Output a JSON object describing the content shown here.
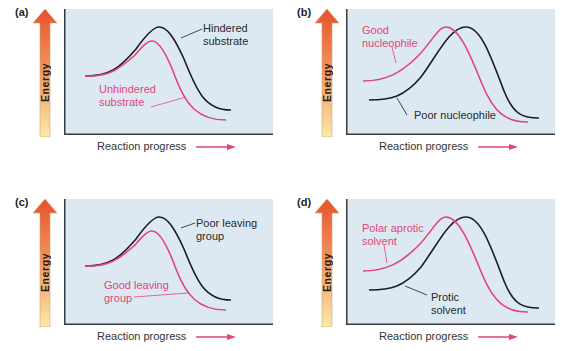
{
  "colors": {
    "plot_background": "#dde9f2",
    "axis": "#3a3a3a",
    "black_curve": "#1c1c24",
    "pink_curve": "#e0457a",
    "arrow_top": "#e8512b",
    "arrow_bottom": "#fbe7a6"
  },
  "axis": {
    "y_label": "Energy",
    "x_label": "Reaction progress"
  },
  "panels": [
    {
      "id": "a",
      "label": "(a)",
      "black_label_line1": "Hindered",
      "black_label_line2": "substrate",
      "pink_label_line1": "Unhindered",
      "pink_label_line2": "substrate"
    },
    {
      "id": "b",
      "label": "(b)",
      "pink_label_line1": "Good",
      "pink_label_line2": "nucleophile",
      "black_label_line1": "Poor nucleophile"
    },
    {
      "id": "c",
      "label": "(c)",
      "black_label_line1": "Poor leaving",
      "black_label_line2": "group",
      "pink_label_line1": "Good leaving",
      "pink_label_line2": "group"
    },
    {
      "id": "d",
      "label": "(d)",
      "pink_label_line1": "Polar aprotic",
      "pink_label_line2": "solvent",
      "black_label_line1": "Protic",
      "black_label_line2": "solvent"
    }
  ]
}
